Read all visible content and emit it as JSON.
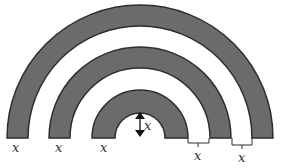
{
  "diagram": {
    "colors": {
      "ring_fill": "#6b6b6b",
      "ring_stroke": "#2e2e2e",
      "background": "#ffffff"
    },
    "rings": [
      {
        "name": "outer",
        "outer_r": 133,
        "inner_r": 112
      },
      {
        "name": "middle",
        "outer_r": 92,
        "inner_r": 71
      },
      {
        "name": "inner",
        "outer_r": 50,
        "inner_r": 25
      }
    ],
    "labels": {
      "ring_width_left_outer": "x",
      "ring_width_left_middle": "x",
      "ring_width_left_inner": "x",
      "inner_radius": "x",
      "gap_inner": "x",
      "gap_outer": "x"
    }
  }
}
